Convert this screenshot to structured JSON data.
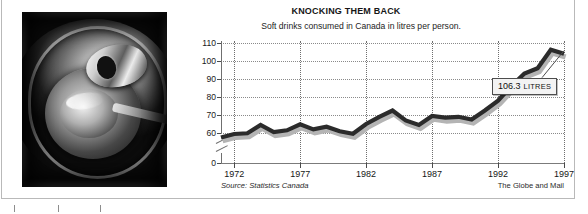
{
  "figure": {
    "photo_alt": "soda-can-top-photo"
  },
  "source_note": "Source: Statistics Canada",
  "credit": "The Globe and Mail",
  "annotation": {
    "value": "106.3",
    "unit": "LITRES"
  },
  "chart_data": {
    "type": "line",
    "title": "KNOCKING THEM BACK",
    "subtitle": "Soft drinks consumed in Canada in litres per person.",
    "xlabel": "",
    "ylabel": "",
    "grid": true,
    "legend": false,
    "axis_break": true,
    "ylim": [
      0,
      110
    ],
    "yticks": [
      0,
      60,
      70,
      80,
      90,
      100,
      110
    ],
    "ytick_labels": [
      "0",
      "60",
      "70",
      "80",
      "90",
      "100",
      "110"
    ],
    "xlim": [
      1971,
      1997
    ],
    "xticks": [
      1972,
      1977,
      1982,
      1987,
      1992,
      1997
    ],
    "xtick_labels": [
      "1972",
      "1977",
      "1982",
      "1987",
      "1992",
      "1997"
    ],
    "x": [
      1971,
      1972,
      1973,
      1974,
      1975,
      1976,
      1977,
      1978,
      1979,
      1980,
      1981,
      1982,
      1983,
      1984,
      1985,
      1986,
      1987,
      1988,
      1989,
      1990,
      1991,
      1992,
      1993,
      1994,
      1995,
      1996,
      1997
    ],
    "values": [
      51.0,
      58.0,
      59.5,
      64.5,
      60.5,
      61.5,
      64.8,
      62.0,
      63.5,
      61.0,
      58.5,
      65.0,
      69.0,
      72.5,
      67.0,
      64.5,
      69.5,
      68.5,
      69.0,
      67.5,
      72.5,
      78.0,
      86.0,
      93.0,
      96.0,
      106.3,
      104.0
    ],
    "series": [
      {
        "name": "Soft drinks per person (litres)",
        "values": [
          51.0,
          58.0,
          59.5,
          64.5,
          60.5,
          61.5,
          64.8,
          62.0,
          63.5,
          61.0,
          58.5,
          65.0,
          69.0,
          72.5,
          67.0,
          64.5,
          69.5,
          68.5,
          69.0,
          67.5,
          72.5,
          78.0,
          86.0,
          93.0,
          96.0,
          106.3,
          104.0
        ]
      }
    ],
    "annotations": [
      {
        "x": 1997,
        "y": 106.3,
        "label": "106.3 LITRES"
      }
    ],
    "line_color": "#2b2b2b",
    "shadow_color": "#b4b4b4"
  }
}
